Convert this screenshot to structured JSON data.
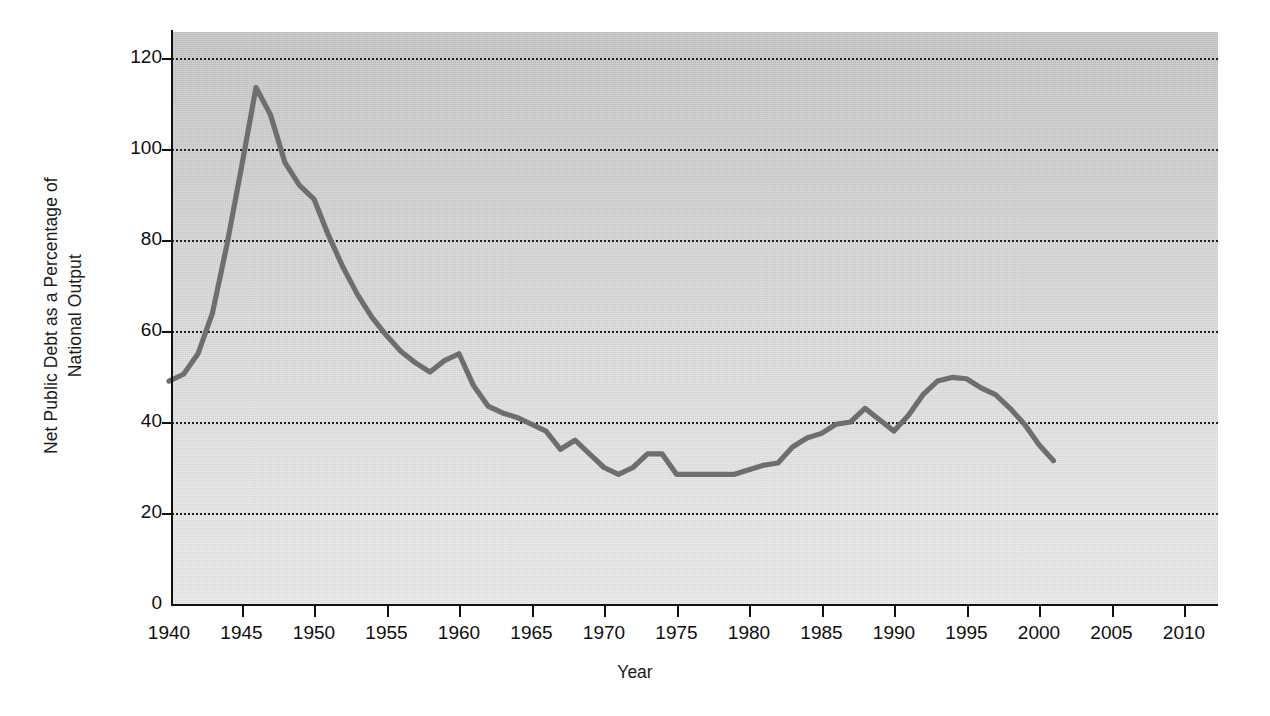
{
  "chart_data": {
    "type": "line",
    "title": "",
    "xlabel": "Year",
    "ylabel": "Net Public Debt as a Percentage of National Output",
    "ylabel_line1": "Net Public Debt as a Percentage of",
    "ylabel_line2": "National Output",
    "xlim": [
      1940,
      2012
    ],
    "ylim": [
      0,
      128
    ],
    "xticks": [
      1940,
      1945,
      1950,
      1955,
      1960,
      1965,
      1970,
      1975,
      1980,
      1985,
      1990,
      1995,
      2000,
      2005,
      2010
    ],
    "xtick_labels": [
      "1940",
      "1945",
      "1950",
      "1955",
      "1960",
      "1965",
      "1970",
      "1975",
      "1980",
      "1985",
      "1990",
      "1995",
      "2000",
      "2005",
      "2010"
    ],
    "yticks": [
      0,
      20,
      40,
      60,
      80,
      100,
      120
    ],
    "ytick_labels": [
      "0",
      "20",
      "40",
      "60",
      "80",
      "100",
      "120"
    ],
    "grid": "horizontal-dotted",
    "legend": "none",
    "series_color": "#6e6e6e",
    "plot_background": "#d8d8d8",
    "x": [
      1940,
      1941,
      1942,
      1943,
      1944,
      1945,
      1946,
      1947,
      1948,
      1949,
      1950,
      1951,
      1952,
      1953,
      1954,
      1955,
      1956,
      1957,
      1958,
      1959,
      1960,
      1961,
      1962,
      1963,
      1964,
      1965,
      1966,
      1967,
      1968,
      1969,
      1970,
      1971,
      1972,
      1973,
      1974,
      1975,
      1976,
      1977,
      1978,
      1979,
      1980,
      1981,
      1982,
      1983,
      1984,
      1985,
      1986,
      1987,
      1988,
      1989,
      1990,
      1991,
      1992,
      1993,
      1994,
      1995,
      1996,
      1997,
      1998,
      1999,
      2000,
      2001
    ],
    "y": [
      49.0,
      50.5,
      55.0,
      64.0,
      79.0,
      96.0,
      113.5,
      107.5,
      97.0,
      92.0,
      89.0,
      81.0,
      74.0,
      68.0,
      63.0,
      59.0,
      55.5,
      53.0,
      51.0,
      53.5,
      55.0,
      48.0,
      43.5,
      42.0,
      41.0,
      39.5,
      38.0,
      34.0,
      36.0,
      33.0,
      30.0,
      28.5,
      30.0,
      33.0,
      33.0,
      28.5,
      28.5,
      28.5,
      28.5,
      28.5,
      29.5,
      30.5,
      31.0,
      34.5,
      36.5,
      37.5,
      39.5,
      40.0,
      43.0,
      40.5,
      38.0,
      41.5,
      46.0,
      49.0,
      49.8,
      49.5,
      47.5,
      46.0,
      43.0,
      39.5,
      35.0,
      31.5
    ],
    "series_name": "Net public debt as a percentage of national output",
    "notable_values": {
      "start_1940": 49.0,
      "peak_1947": 113.5,
      "local_low_1958": 51.0,
      "local_peak_1960": 55.0,
      "trough_1975_1979": 28.5,
      "local_peak_1988": 43.0,
      "local_low_1990": 38.0,
      "peak_1994": 49.8,
      "end_2001": 31.5
    }
  }
}
